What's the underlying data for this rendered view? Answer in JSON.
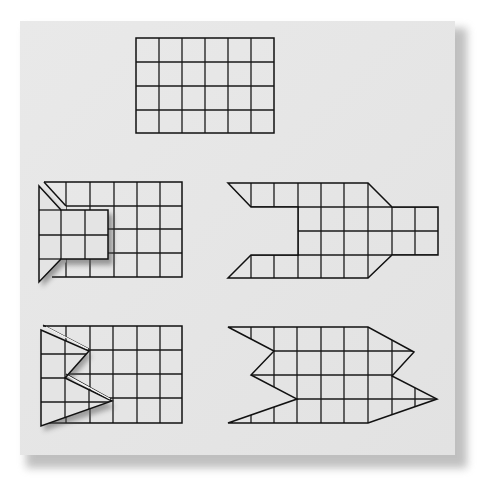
{
  "figure": {
    "description": "Five grid-paper cut-and-fold figures on a gray sheet",
    "colors": {
      "page_background": "#ffffff",
      "paper": "#e6e6e6",
      "paper_shadow": "#9a9a9a",
      "line": "#1a1a1a"
    },
    "cell_size_px": {
      "w": 23.3,
      "h": 24
    },
    "panels": [
      {
        "id": "top-grid",
        "label": "Uncut grid",
        "columns": 6,
        "rows": 4
      },
      {
        "id": "middle-left",
        "label": "Grid with folded flap (rectangular notch)",
        "columns": 6,
        "rows": 4,
        "flap": {
          "columns": 3,
          "rows": 2
        }
      },
      {
        "id": "middle-right",
        "label": "Unfolded shape with rectangular notch and tab",
        "columns": 8,
        "rows": 4
      },
      {
        "id": "bottom-left",
        "label": "Grid with folded zig-zag flap",
        "columns": 6,
        "rows": 4
      },
      {
        "id": "bottom-right",
        "label": "Unfolded zig-zag shape",
        "columns": 8,
        "rows": 4
      }
    ]
  }
}
